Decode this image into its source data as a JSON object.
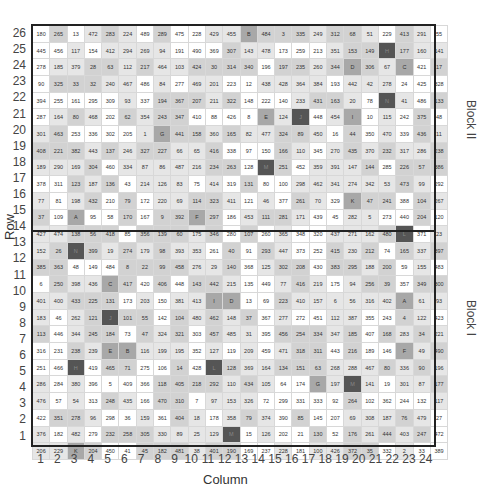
{
  "chart_data": {
    "type": "table",
    "title": "",
    "xlabel": "Column",
    "ylabel": "Row",
    "columns": [
      1,
      2,
      3,
      4,
      5,
      6,
      7,
      8,
      9,
      10,
      11,
      12,
      13,
      14,
      15,
      16,
      17,
      18,
      19,
      20,
      21,
      22,
      23,
      24
    ],
    "rows_top_to_bottom": [
      26,
      25,
      24,
      23,
      22,
      21,
      20,
      19,
      18,
      17,
      16,
      15,
      14,
      13,
      12,
      11,
      10,
      9,
      8,
      7,
      6,
      5,
      4,
      3,
      2,
      1
    ],
    "blocks": [
      {
        "label": "Block II",
        "rows": "14-26"
      },
      {
        "label": "Block I",
        "rows": "1-13"
      }
    ],
    "cells": [
      [
        "180",
        "265",
        "13",
        "472",
        "283",
        "224",
        "489",
        "289",
        "475",
        "228",
        "429",
        "455",
        "B",
        "484",
        "3",
        "335",
        "249",
        "312",
        "68",
        "51",
        "229",
        "413",
        "291",
        "55"
      ],
      [
        "445",
        "456",
        "117",
        "154",
        "412",
        "294",
        "269",
        "94",
        "191",
        "490",
        "369",
        "307",
        "143",
        "478",
        "173",
        "259",
        "213",
        "351",
        "153",
        "149",
        "H",
        "177",
        "160",
        "141"
      ],
      [
        "278",
        "185",
        "379",
        "28",
        "63",
        "112",
        "217",
        "464",
        "103",
        "424",
        "30",
        "314",
        "340",
        "196",
        "197",
        "235",
        "260",
        "344",
        "D",
        "306",
        "67",
        "C",
        "421",
        "17"
      ],
      [
        "90",
        "325",
        "33",
        "32",
        "240",
        "467",
        "486",
        "84",
        "277",
        "469",
        "201",
        "223",
        "12",
        "438",
        "428",
        "364",
        "384",
        "193",
        "442",
        "42",
        "278",
        "24",
        "425",
        "328"
      ],
      [
        "394",
        "255",
        "161",
        "295",
        "309",
        "93",
        "337",
        "194",
        "367",
        "207",
        "211",
        "322",
        "148",
        "222",
        "140",
        "233",
        "431",
        "163",
        "20",
        "78",
        "N",
        "41",
        "486",
        "133"
      ],
      [
        "287",
        "164",
        "80",
        "468",
        "202",
        "62",
        "354",
        "243",
        "347",
        "410",
        "88",
        "426",
        "8",
        "E",
        "124",
        "J",
        "448",
        "454",
        "I",
        "10",
        "115",
        "242",
        "375",
        "48"
      ],
      [
        "301",
        "463",
        "253",
        "336",
        "302",
        "205",
        "1",
        "G",
        "441",
        "158",
        "360",
        "165",
        "82",
        "477",
        "324",
        "89",
        "450",
        "16",
        "44",
        "350",
        "470",
        "339",
        "436",
        "11"
      ],
      [
        "408",
        "221",
        "382",
        "443",
        "137",
        "246",
        "327",
        "227",
        "66",
        "65",
        "416",
        "338",
        "97",
        "150",
        "166",
        "110",
        "345",
        "270",
        "435",
        "370",
        "232",
        "317",
        "286",
        "238"
      ],
      [
        "189",
        "290",
        "169",
        "304",
        "460",
        "334",
        "87",
        "86",
        "487",
        "216",
        "234",
        "263",
        "128",
        "M",
        "251",
        "452",
        "359",
        "391",
        "147",
        "144",
        "285",
        "226",
        "57",
        "386"
      ],
      [
        "378",
        "311",
        "123",
        "187",
        "136",
        "43",
        "214",
        "126",
        "83",
        "75",
        "414",
        "319",
        "131",
        "80",
        "100",
        "298",
        "462",
        "341",
        "274",
        "342",
        "53",
        "473",
        "99",
        "292"
      ],
      [
        "77",
        "81",
        "198",
        "432",
        "210",
        "79",
        "172",
        "220",
        "69",
        "114",
        "323",
        "411",
        "121",
        "46",
        "377",
        "261",
        "70",
        "329",
        "K",
        "47",
        "241",
        "388",
        "104",
        "267"
      ],
      [
        "37",
        "109",
        "A",
        "95",
        "58",
        "170",
        "167",
        "9",
        "392",
        "F",
        "297",
        "186",
        "453",
        "111",
        "281",
        "171",
        "439",
        "45",
        "282",
        "5",
        "273",
        "440",
        "204",
        "120"
      ],
      [
        "427",
        "474",
        "138",
        "56",
        "418",
        "85",
        "356",
        "139",
        "60",
        "175",
        "346",
        "280",
        "107",
        "260",
        "365",
        "348",
        "320",
        "437",
        "271",
        "162",
        "480",
        "L",
        "371",
        "23"
      ],
      [
        "152",
        "26",
        "N",
        "399",
        "19",
        "274",
        "179",
        "98",
        "393",
        "353",
        "261",
        "40",
        "91",
        "293",
        "447",
        "373",
        "252",
        "415",
        "230",
        "212",
        "74",
        "165",
        "337",
        "397"
      ],
      [
        "385",
        "363",
        "48",
        "149",
        "484",
        "8",
        "22",
        "99",
        "458",
        "276",
        "29",
        "140",
        "368",
        "125",
        "302",
        "208",
        "430",
        "383",
        "295",
        "188",
        "200",
        "59",
        "155",
        "483"
      ],
      [
        "6",
        "250",
        "398",
        "436",
        "C",
        "417",
        "420",
        "406",
        "448",
        "143",
        "442",
        "215",
        "135",
        "449",
        "77",
        "416",
        "219",
        "175",
        "94",
        "256",
        "39",
        "357",
        "349",
        "300"
      ],
      [
        "401",
        "400",
        "433",
        "225",
        "131",
        "173",
        "203",
        "150",
        "381",
        "413",
        "I",
        "D",
        "13",
        "69",
        "223",
        "410",
        "157",
        "6",
        "56",
        "316",
        "402",
        "A",
        "61",
        "93"
      ],
      [
        "183",
        "46",
        "262",
        "121",
        "J",
        "101",
        "55",
        "142",
        "104",
        "480",
        "462",
        "148",
        "37",
        "367",
        "277",
        "272",
        "451",
        "112",
        "387",
        "355",
        "243",
        "4",
        "122",
        "423"
      ],
      [
        "113",
        "446",
        "344",
        "245",
        "184",
        "73",
        "47",
        "324",
        "321",
        "303",
        "457",
        "485",
        "31",
        "395",
        "456",
        "254",
        "334",
        "347",
        "185",
        "407",
        "168",
        "283",
        "34",
        "221"
      ],
      [
        "316",
        "231",
        "238",
        "239",
        "E",
        "B",
        "116",
        "199",
        "195",
        "352",
        "127",
        "119",
        "209",
        "459",
        "471",
        "318",
        "311",
        "443",
        "216",
        "189",
        "146",
        "F",
        "49",
        "490"
      ],
      [
        "251",
        "466",
        "H",
        "419",
        "465",
        "71",
        "275",
        "106",
        "14",
        "428",
        "L",
        "128",
        "369",
        "164",
        "134",
        "151",
        "63",
        "268",
        "288",
        "467",
        "80",
        "336",
        "90",
        "196"
      ],
      [
        "286",
        "284",
        "380",
        "396",
        "5",
        "409",
        "366",
        "118",
        "405",
        "218",
        "292",
        "110",
        "434",
        "105",
        "64",
        "174",
        "G",
        "197",
        "M",
        "141",
        "19",
        "301",
        "87",
        "177"
      ],
      [
        "476",
        "57",
        "54",
        "313",
        "248",
        "435",
        "166",
        "470",
        "310",
        "7",
        "97",
        "153",
        "326",
        "72",
        "299",
        "331",
        "333",
        "92",
        "264",
        "102",
        "362",
        "244",
        "132",
        "117"
      ],
      [
        "422",
        "351",
        "278",
        "96",
        "298",
        "36",
        "159",
        "361",
        "404",
        "18",
        "178",
        "358",
        "79",
        "374",
        "390",
        "85",
        "145",
        "207",
        "69",
        "308",
        "187",
        "76",
        "479",
        "27"
      ],
      [
        "376",
        "182",
        "482",
        "279",
        "232",
        "258",
        "305",
        "330",
        "89",
        "25",
        "129",
        "M",
        "15",
        "126",
        "202",
        "21",
        "130",
        "52",
        "176",
        "261",
        "444",
        "403",
        "247",
        "472"
      ],
      [
        "206",
        "229",
        "K",
        "204",
        "450",
        "41",
        "45",
        "182",
        "481",
        "38",
        "401",
        "190",
        "169",
        "237",
        "228",
        "181",
        "100",
        "426",
        "372",
        "35",
        "332",
        "2",
        "33",
        "389"
      ]
    ]
  },
  "axes": {
    "row_title": "Row",
    "col_title": "Column",
    "block_top": "Block II",
    "block_bottom": "Block I"
  }
}
